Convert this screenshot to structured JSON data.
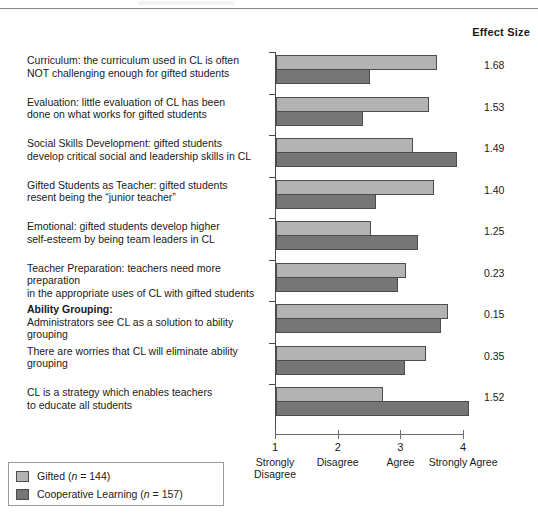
{
  "header": {
    "effect_size_label": "Effect Size"
  },
  "chart_data": {
    "type": "bar",
    "orientation": "horizontal",
    "title": "",
    "xlabel": "",
    "ylabel": "",
    "xlim": [
      1,
      4
    ],
    "grid": false,
    "legend_position": "bottom-left",
    "x_ticks": [
      {
        "value": "1",
        "caption": "Strongly Disagree"
      },
      {
        "value": "2",
        "caption": "Disagree"
      },
      {
        "value": "3",
        "caption": "Agree"
      },
      {
        "value": "4",
        "caption": "Strongly Agree"
      }
    ],
    "categories": [
      "Curriculum: the curriculum used in CL is often NOT challenging enough for gifted students",
      "Evaluation: little evaluation of CL has been done on what works for gifted students",
      "Social Skills Development: gifted students develop critical social and leadership skills in CL",
      "Gifted Students as Teacher: gifted students resent being the “junior teacher”",
      "Emotional: gifted students develop higher self-esteem by being team leaders in CL",
      "Teacher Preparation: teachers need more preparation in the appropriate uses of CL with gifted students",
      "Ability Grouping: Administrators see CL as a solution to ability grouping",
      "There are worries that CL will eliminate ability grouping",
      "CL is a strategy which enables teachers to educate all students"
    ],
    "series": [
      {
        "name": "Gifted (n = 144)",
        "color": "#b3b3b3",
        "values": [
          3.57,
          3.44,
          3.18,
          3.52,
          2.51,
          3.07,
          3.74,
          3.39,
          2.7
        ]
      },
      {
        "name": "Cooperative Learning (n = 157)",
        "color": "#767676",
        "values": [
          2.5,
          2.39,
          3.88,
          2.6,
          3.27,
          2.95,
          3.63,
          3.05,
          4.08
        ]
      }
    ],
    "effect_sizes": [
      1.68,
      1.53,
      1.49,
      1.4,
      1.25,
      0.23,
      0.15,
      0.35,
      1.52
    ]
  },
  "rows": [
    {
      "line1": "Curriculum: the curriculum used in CL is often",
      "line2": "NOT challenging enough for gifted students",
      "bold_lead": "",
      "effect_size": "1.68"
    },
    {
      "line1": "Evaluation: little evaluation of CL has been",
      "line2": "done on what works for gifted students",
      "bold_lead": "",
      "effect_size": "1.53"
    },
    {
      "line1": "Social Skills Development: gifted students",
      "line2": "develop critical social and leadership skills in CL",
      "bold_lead": "",
      "effect_size": "1.49"
    },
    {
      "line1": "Gifted Students as Teacher: gifted students",
      "line2": "resent being the “junior teacher”",
      "bold_lead": "",
      "effect_size": "1.40"
    },
    {
      "line1": "Emotional: gifted students develop higher",
      "line2": "self-esteem by being team leaders in CL",
      "bold_lead": "",
      "effect_size": "1.25"
    },
    {
      "line1": "Teacher Preparation: teachers need more preparation",
      "line2": "in the appropriate uses of CL with gifted students",
      "bold_lead": "",
      "effect_size": "0.23"
    },
    {
      "line1": "Administrators see CL as a solution to ability grouping",
      "line2": "",
      "bold_lead": "Ability Grouping:",
      "effect_size": "0.15"
    },
    {
      "line1": "There are worries that CL will eliminate ability grouping",
      "line2": "",
      "bold_lead": "",
      "effect_size": "0.35"
    },
    {
      "line1": "CL is a strategy which enables teachers",
      "line2": "to educate all students",
      "bold_lead": "",
      "effect_size": "1.52"
    }
  ],
  "legend": {
    "items": [
      {
        "label_pre": "Gifted (",
        "label_italic": "n",
        "label_post": " = 144)"
      },
      {
        "label_pre": "Cooperative Learning (",
        "label_italic": "n",
        "label_post": " = 157)"
      }
    ]
  }
}
